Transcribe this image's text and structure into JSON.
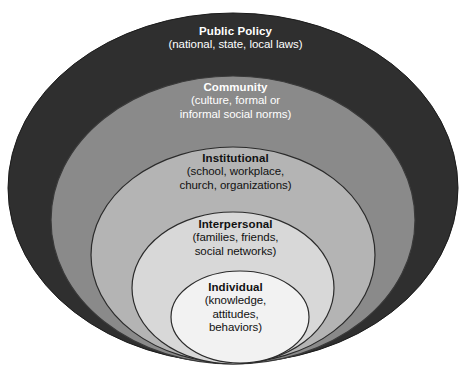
{
  "diagram": {
    "type": "nested-ellipse-layers",
    "background_color": "#ffffff",
    "layers": [
      {
        "id": "public-policy",
        "title": "Public Policy",
        "subtitle_lines": [
          "(national, state, local laws)"
        ],
        "fill": "#2f2f2f",
        "text_color": "#ffffff",
        "level": 5
      },
      {
        "id": "community",
        "title": "Community",
        "subtitle_lines": [
          "(culture, formal or",
          "informal social norms)"
        ],
        "fill": "#8a8a8a",
        "text_color": "#ffffff",
        "level": 4
      },
      {
        "id": "institutional",
        "title": "Institutional",
        "subtitle_lines": [
          "(school, workplace,",
          "church, organizations)"
        ],
        "fill": "#b4b4b4",
        "text_color": "#111111",
        "level": 3
      },
      {
        "id": "interpersonal",
        "title": "Interpersonal",
        "subtitle_lines": [
          "(families, friends,",
          "social networks)"
        ],
        "fill": "#d8d8d8",
        "text_color": "#111111",
        "level": 2
      },
      {
        "id": "individual",
        "title": "Individual",
        "subtitle_lines": [
          "(knowledge,",
          "attitudes,",
          "behaviors)"
        ],
        "fill": "#f2f2f2",
        "text_color": "#111111",
        "level": 1
      }
    ]
  }
}
